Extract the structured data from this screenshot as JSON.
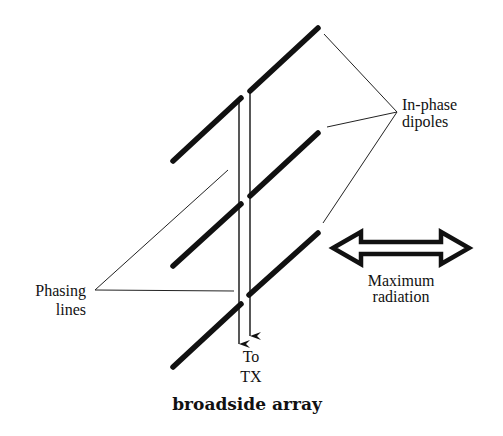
{
  "caption": "broadside array",
  "labels": {
    "in_phase_line1": "In-phase",
    "in_phase_line2": "dipoles",
    "max_line1": "Maximum",
    "max_line2": "radiation",
    "phasing_line1": "Phasing",
    "phasing_line2": "lines",
    "to_line1": "To",
    "to_line2": "TX"
  },
  "colors": {
    "ink": "#111111",
    "background": "#ffffff"
  },
  "elements": {
    "dipoles": [
      {
        "name": "dipole-top-right",
        "x1": 250,
        "y1": 91,
        "x2": 318,
        "y2": 28
      },
      {
        "name": "dipole-top-left",
        "x1": 173,
        "y1": 161,
        "x2": 241,
        "y2": 98
      },
      {
        "name": "dipole-middle-right",
        "x1": 250,
        "y1": 196,
        "x2": 318,
        "y2": 133
      },
      {
        "name": "dipole-middle-left",
        "x1": 173,
        "y1": 266,
        "x2": 241,
        "y2": 204
      },
      {
        "name": "dipole-bottom-right",
        "x1": 249,
        "y1": 295,
        "x2": 318,
        "y2": 233
      },
      {
        "name": "dipole-bottom-left",
        "x1": 173,
        "y1": 367,
        "x2": 241,
        "y2": 304
      }
    ],
    "feed_lines": [
      "left feed line to TX",
      "right feed line to TX"
    ],
    "radiation_arrow": "double-headed hollow arrow"
  }
}
